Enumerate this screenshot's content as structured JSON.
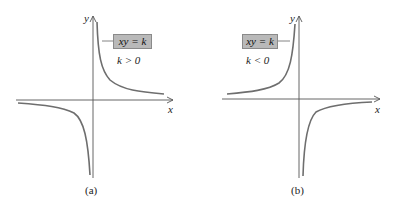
{
  "panels": [
    {
      "id": "a",
      "caption": "(a)",
      "equation": "xy = k",
      "condition": "k > 0",
      "x_axis_label": "x",
      "y_axis_label": "y"
    },
    {
      "id": "b",
      "caption": "(b)",
      "equation": "xy = k",
      "condition": "k < 0",
      "x_axis_label": "x",
      "y_axis_label": "y"
    }
  ],
  "colors": {
    "curve": "#6e6e6e",
    "axis": "#555555",
    "label_box": "#b9b9b9"
  }
}
